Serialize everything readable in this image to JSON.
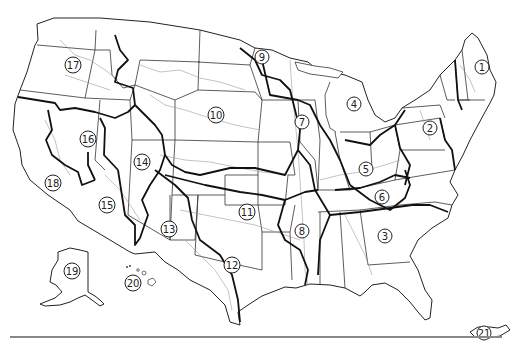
{
  "map": {
    "title": "Hydrologic regions of the United States",
    "regions": [
      {
        "id": "1",
        "label": "1",
        "x": 482,
        "y": 67
      },
      {
        "id": "2",
        "label": "2",
        "x": 430,
        "y": 128
      },
      {
        "id": "3",
        "label": "3",
        "x": 385,
        "y": 236
      },
      {
        "id": "4",
        "label": "4",
        "x": 354,
        "y": 104
      },
      {
        "id": "5",
        "label": "5",
        "x": 366,
        "y": 169
      },
      {
        "id": "6",
        "label": "6",
        "x": 382,
        "y": 197
      },
      {
        "id": "7",
        "label": "7",
        "x": 302,
        "y": 122
      },
      {
        "id": "8",
        "label": "8",
        "x": 302,
        "y": 231
      },
      {
        "id": "9",
        "label": "9",
        "x": 262,
        "y": 57
      },
      {
        "id": "10",
        "label": "10",
        "x": 216,
        "y": 115
      },
      {
        "id": "11",
        "label": "11",
        "x": 247,
        "y": 212
      },
      {
        "id": "12",
        "label": "12",
        "x": 232,
        "y": 265
      },
      {
        "id": "13",
        "label": "13",
        "x": 169,
        "y": 229
      },
      {
        "id": "14",
        "label": "14",
        "x": 142,
        "y": 162
      },
      {
        "id": "15",
        "label": "15",
        "x": 107,
        "y": 205
      },
      {
        "id": "16",
        "label": "16",
        "x": 88,
        "y": 139
      },
      {
        "id": "17",
        "label": "17",
        "x": 73,
        "y": 65
      },
      {
        "id": "18",
        "label": "18",
        "x": 53,
        "y": 183
      },
      {
        "id": "19",
        "label": "19",
        "x": 72,
        "y": 271
      },
      {
        "id": "20",
        "label": "20",
        "x": 133,
        "y": 283
      },
      {
        "id": "21",
        "label": "21",
        "x": 484,
        "y": 333
      }
    ]
  }
}
